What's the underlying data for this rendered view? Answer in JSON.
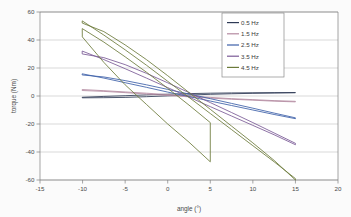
{
  "chart_data": {
    "type": "line",
    "title": "",
    "xlabel": "angle (°)",
    "ylabel": "torque (Nm)",
    "xlim": [
      -15,
      20
    ],
    "ylim": [
      -60,
      60
    ],
    "xticks": [
      -15,
      -10,
      -5,
      0,
      5,
      10,
      15,
      20
    ],
    "xtick_labels": [
      "-15",
      "-10",
      "-5",
      "0",
      "5",
      "10",
      "15",
      "20"
    ],
    "yticks": [
      -60,
      -40,
      -20,
      0,
      20,
      40,
      60
    ],
    "ytick_labels": [
      "-60",
      "-40",
      "-20",
      "0",
      "20",
      "40",
      "60"
    ],
    "grid": "horizontal",
    "legend_position": "top-right",
    "series": [
      {
        "name": "0.5 Hz",
        "color": "#2e3a55",
        "shape": "hysteresis-loop",
        "x_range": [
          -10,
          15
        ],
        "loop_width": 0.7,
        "y_at_xmin": -1.2,
        "y_at_xmax": 2.4,
        "crossing_x": 2.5,
        "points_upper": [
          [
            -10,
            -0.9
          ],
          [
            -7.5,
            -0.3
          ],
          [
            -5,
            0.2
          ],
          [
            -2.5,
            0.8
          ],
          [
            0,
            1.3
          ],
          [
            2.5,
            1.7
          ],
          [
            5,
            2.0
          ],
          [
            7.5,
            2.2
          ],
          [
            10,
            2.3
          ],
          [
            12.5,
            2.4
          ],
          [
            15,
            2.5
          ]
        ],
        "points_lower": [
          [
            15,
            2.3
          ],
          [
            12.5,
            2.1
          ],
          [
            10,
            1.9
          ],
          [
            7.5,
            1.6
          ],
          [
            5,
            1.2
          ],
          [
            2.5,
            0.7
          ],
          [
            0,
            0.1
          ],
          [
            -2.5,
            -0.5
          ],
          [
            -5,
            -1.0
          ],
          [
            -7.5,
            -1.2
          ],
          [
            -10,
            -1.3
          ]
        ]
      },
      {
        "name": "1.5 Hz",
        "color": "#b48aa0",
        "shape": "hysteresis-loop",
        "x_range": [
          -10,
          15
        ],
        "loop_width": 1.2,
        "y_at_xmin": 4.2,
        "y_at_xmax": -4.0,
        "crossing_x": 2.5,
        "points_upper": [
          [
            -10,
            4.6
          ],
          [
            -7.5,
            3.8
          ],
          [
            -5,
            2.9
          ],
          [
            -2.5,
            2.0
          ],
          [
            0,
            1.0
          ],
          [
            2.5,
            0.0
          ],
          [
            5,
            -1.0
          ],
          [
            7.5,
            -1.9
          ],
          [
            10,
            -2.6
          ],
          [
            12.5,
            -3.3
          ],
          [
            15,
            -3.8
          ]
        ],
        "points_lower": [
          [
            15,
            -4.2
          ],
          [
            12.5,
            -3.7
          ],
          [
            10,
            -3.0
          ],
          [
            7.5,
            -2.3
          ],
          [
            5,
            -1.5
          ],
          [
            2.5,
            -0.6
          ],
          [
            0,
            0.4
          ],
          [
            -2.5,
            1.4
          ],
          [
            -5,
            2.4
          ],
          [
            -7.5,
            3.3
          ],
          [
            -10,
            3.9
          ]
        ]
      },
      {
        "name": "2.5 Hz",
        "color": "#3b5fa8",
        "shape": "hysteresis-loop",
        "x_range": [
          -10,
          15
        ],
        "loop_width": 3.0,
        "y_at_xmin": 15.5,
        "y_at_xmax": -16.0,
        "crossing_x": 2.5,
        "points_upper": [
          [
            -10,
            15.8
          ],
          [
            -7.5,
            12.8
          ],
          [
            -5,
            9.5
          ],
          [
            -2.5,
            6.2
          ],
          [
            0,
            2.8
          ],
          [
            2.5,
            -0.4
          ],
          [
            5,
            -3.6
          ],
          [
            7.5,
            -6.8
          ],
          [
            10,
            -10.0
          ],
          [
            12.5,
            -13.2
          ],
          [
            15,
            -16.2
          ]
        ],
        "points_lower": [
          [
            15,
            -15.6
          ],
          [
            12.5,
            -12.2
          ],
          [
            10,
            -8.7
          ],
          [
            7.5,
            -5.3
          ],
          [
            5,
            -1.9
          ],
          [
            2.5,
            1.4
          ],
          [
            0,
            4.7
          ],
          [
            -2.5,
            8.0
          ],
          [
            -5,
            11.0
          ],
          [
            -7.5,
            13.6
          ],
          [
            -10,
            15.0
          ]
        ]
      },
      {
        "name": "3.5 Hz",
        "color": "#7a5a96",
        "shape": "hysteresis-loop",
        "x_range": [
          -10,
          15
        ],
        "loop_width": 4.5,
        "y_at_xmin": 28.5,
        "y_at_xmax": -34.5,
        "crossing_x": 2.5,
        "points_upper": [
          [
            -10,
            32.0
          ],
          [
            -7.5,
            26.0
          ],
          [
            -5,
            19.5
          ],
          [
            -2.5,
            12.8
          ],
          [
            0,
            6.0
          ],
          [
            2.5,
            -0.8
          ],
          [
            5,
            -7.6
          ],
          [
            7.5,
            -14.3
          ],
          [
            10,
            -21.0
          ],
          [
            12.5,
            -27.7
          ],
          [
            15,
            -34.8
          ]
        ],
        "points_lower": [
          [
            15,
            -33.8
          ],
          [
            12.5,
            -26.4
          ],
          [
            10,
            -19.0
          ],
          [
            7.5,
            -11.8
          ],
          [
            5,
            -4.7
          ],
          [
            2.5,
            2.4
          ],
          [
            0,
            9.4
          ],
          [
            -2.5,
            16.2
          ],
          [
            -5,
            22.4
          ],
          [
            -7.5,
            27.4
          ],
          [
            -10,
            30.0
          ]
        ]
      },
      {
        "name": "4.5 Hz",
        "color": "#6b7a3a",
        "shape": "hysteresis-loop",
        "x_range": [
          -10,
          15
        ],
        "loop_width": 6.0,
        "y_at_xmin": 53.5,
        "y_at_xmax": -60.0,
        "crossing_x": 2.5,
        "points_upper": [
          [
            -10,
            53.5
          ],
          [
            -7.5,
            43.5
          ],
          [
            -5,
            33.0
          ],
          [
            -2.5,
            22.0
          ],
          [
            0,
            10.5
          ],
          [
            2.5,
            -1.0
          ],
          [
            5,
            -12.5
          ],
          [
            7.5,
            -24.0
          ],
          [
            10,
            -35.5
          ],
          [
            12.5,
            -47.0
          ],
          [
            15,
            -59.0
          ]
        ],
        "points_lower": [
          [
            15,
            -60.0
          ],
          [
            12.5,
            -46.0
          ],
          [
            10,
            -33.5
          ],
          [
            7.5,
            -21.5
          ],
          [
            5,
            -9.5
          ],
          [
            2.5,
            2.5
          ],
          [
            0,
            14.5
          ],
          [
            -2.5,
            26.0
          ],
          [
            -5,
            36.5
          ],
          [
            -7.5,
            46.0
          ],
          [
            -10,
            52.0
          ]
        ]
      },
      {
        "name": "4.5 Hz inner",
        "color": "#6b7a3a",
        "shape": "hysteresis-loop-partial",
        "x_range": [
          -10,
          5
        ],
        "loop_width": 5.0,
        "y_at_xmin": 48.0,
        "y_at_xmax": -47.0,
        "crossing_x": 2.0,
        "points_upper": [
          [
            -10,
            48.0
          ],
          [
            -7.5,
            38.5
          ],
          [
            -5,
            28.0
          ],
          [
            -2.5,
            17.0
          ],
          [
            0,
            5.5
          ],
          [
            2.5,
            -6.5
          ],
          [
            5,
            -19.0
          ]
        ],
        "points_lower": [
          [
            5,
            -47.0
          ],
          [
            2.5,
            -33.0
          ],
          [
            0,
            -20.0
          ],
          [
            -2.5,
            -6.0
          ],
          [
            -5,
            8.0
          ],
          [
            -7.5,
            24.0
          ],
          [
            -10,
            42.0
          ]
        ]
      }
    ]
  },
  "legend": {
    "items": [
      {
        "label": "0.5 Hz",
        "color": "#2e3a55"
      },
      {
        "label": "1.5 Hz",
        "color": "#b48aa0"
      },
      {
        "label": "2.5 Hz",
        "color": "#3b5fa8"
      },
      {
        "label": "3.5 Hz",
        "color": "#7a5a96"
      },
      {
        "label": "4.5 Hz",
        "color": "#6b7a3a"
      }
    ]
  },
  "axes": {
    "x_title": "angle (°)",
    "y_title": "torque (Nm)",
    "x_tick_labels": [
      "-15",
      "-10",
      "-5",
      "0",
      "5",
      "10",
      "15",
      "20"
    ],
    "y_tick_labels": [
      "60",
      "40",
      "20",
      "0",
      "-20",
      "-40",
      "-60"
    ]
  },
  "style": {
    "plot_background": "#ffffff",
    "figure_background": "#fbfbfb",
    "grid_color": "#bfbfbf",
    "axis_color": "#808080",
    "text_color": "#4a4a4a"
  }
}
